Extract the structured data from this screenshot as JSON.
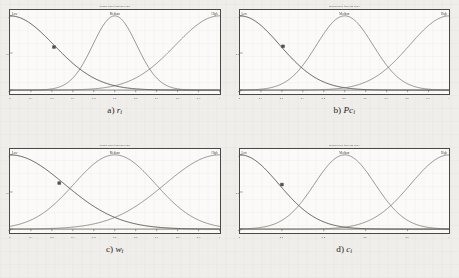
{
  "figure": {
    "page_background": "#f0eeea",
    "plot_background": "#fbfaf8",
    "axis_color": "#4a4744",
    "curve_color": "#6b6865",
    "highlight_curve_color": "#56534f"
  },
  "chart_data": [
    {
      "type": "line",
      "panel": "a",
      "title": "Membership function plots",
      "caption_prefix": "a)",
      "caption_symbol": "r",
      "caption_subscript": "i",
      "xlabel": "",
      "ylabel": "",
      "xlim": [
        0,
        1
      ],
      "ylim": [
        0,
        1
      ],
      "grid": false,
      "legend_position": "top-inside",
      "annotations": [
        "Low",
        "Medium",
        "High"
      ],
      "xticks": [
        "0",
        "0.1",
        "0.2",
        "0.3",
        "0.4",
        "0.5",
        "0.6",
        "0.7",
        "0.8",
        "0.9",
        "1"
      ],
      "yticks": [
        "0",
        "0.5",
        "1"
      ],
      "series": [
        {
          "name": "Low",
          "shape": "gaussian",
          "center": 0.0,
          "sigma": 0.21,
          "peak": 1.0
        },
        {
          "name": "Medium",
          "shape": "gaussian",
          "center": 0.5,
          "sigma": 0.105,
          "peak": 1.0
        },
        {
          "name": "High",
          "shape": "gaussian",
          "center": 1.0,
          "sigma": 0.21,
          "peak": 1.0
        }
      ],
      "marker": {
        "x": 0.21,
        "y": 0.58
      }
    },
    {
      "type": "line",
      "panel": "b",
      "title": "Membership function plots",
      "caption_prefix": "b)",
      "caption_symbol": "Pc",
      "caption_subscript": "i",
      "xlabel": "",
      "ylabel": "",
      "xlim": [
        0,
        1
      ],
      "ylim": [
        0,
        1
      ],
      "grid": false,
      "legend_position": "top-inside",
      "annotations": [
        "Low",
        "Medium",
        "High"
      ],
      "xticks": [
        "0",
        "0.1",
        "0.2",
        "0.3",
        "0.4",
        "0.5",
        "0.6",
        "0.7",
        "0.8",
        "0.9",
        "1"
      ],
      "yticks": [
        "0",
        "0.5",
        "1"
      ],
      "series": [
        {
          "name": "Low",
          "shape": "gaussian",
          "center": 0.0,
          "sigma": 0.19,
          "peak": 1.0
        },
        {
          "name": "Medium",
          "shape": "gaussian",
          "center": 0.5,
          "sigma": 0.135,
          "peak": 1.0
        },
        {
          "name": "High",
          "shape": "gaussian",
          "center": 1.0,
          "sigma": 0.19,
          "peak": 1.0
        }
      ],
      "marker": {
        "x": 0.205,
        "y": 0.59
      }
    },
    {
      "type": "line",
      "panel": "c",
      "title": "Membership function plots",
      "caption_prefix": "c)",
      "caption_symbol": "w",
      "caption_subscript": "i",
      "xlabel": "",
      "ylabel": "",
      "xlim": [
        0,
        1
      ],
      "ylim": [
        0,
        1
      ],
      "grid": false,
      "legend_position": "top-inside",
      "annotations": [
        "Low",
        "Medium",
        "High"
      ],
      "xticks": [
        "0",
        "0.1",
        "0.2",
        "0.3",
        "0.4",
        "0.5",
        "0.6",
        "0.7",
        "0.8",
        "0.9",
        "1"
      ],
      "yticks": [
        "0",
        "0.5",
        "1"
      ],
      "series": [
        {
          "name": "Low",
          "shape": "gaussian",
          "center": 0.0,
          "sigma": 0.26,
          "peak": 1.0
        },
        {
          "name": "Medium",
          "shape": "gaussian",
          "center": 0.5,
          "sigma": 0.195,
          "peak": 1.0
        },
        {
          "name": "High",
          "shape": "gaussian",
          "center": 1.0,
          "sigma": 0.26,
          "peak": 1.0
        }
      ],
      "marker": {
        "x": 0.235,
        "y": 0.62
      }
    },
    {
      "type": "line",
      "panel": "d",
      "title": "Membership function plots",
      "caption_prefix": "d)",
      "caption_symbol": "c",
      "caption_subscript": "i",
      "xlabel": "",
      "ylabel": "",
      "xlim": [
        0,
        1
      ],
      "ylim": [
        0,
        1
      ],
      "grid": false,
      "legend_position": "top-inside",
      "annotations": [
        "Low",
        "Medium",
        "High"
      ],
      "xticks": [
        "0",
        "0.2",
        "0.4",
        "0.6",
        "0.8",
        "1"
      ],
      "yticks": [
        "0",
        "0.5",
        "1"
      ],
      "series": [
        {
          "name": "Low",
          "shape": "gaussian",
          "center": 0.0,
          "sigma": 0.185,
          "peak": 1.0
        },
        {
          "name": "Medium",
          "shape": "gaussian",
          "center": 0.5,
          "sigma": 0.145,
          "peak": 1.0
        },
        {
          "name": "High",
          "shape": "gaussian",
          "center": 1.0,
          "sigma": 0.185,
          "peak": 1.0
        }
      ],
      "marker": {
        "x": 0.2,
        "y": 0.6
      }
    }
  ]
}
